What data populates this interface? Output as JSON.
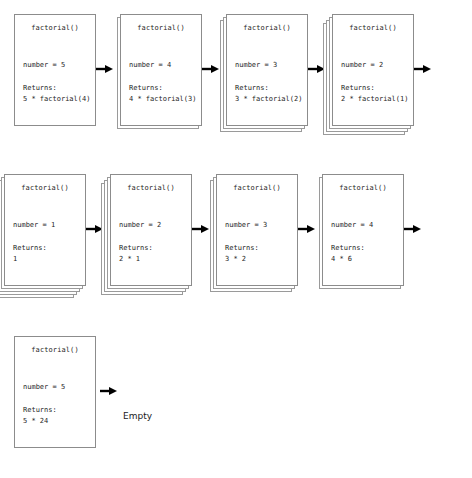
{
  "diagram": {
    "card_title": "factorial()",
    "returns_label": "Returns:",
    "empty_label": "Empty",
    "arrow_icon": "arrow-right-icon",
    "colors": {
      "background": "#ffffff",
      "card_border": "#8c8c8c",
      "layer_border": "#9a9a9a",
      "text": "#262626",
      "arrow": "#000000"
    },
    "rows": [
      {
        "name": "call-phase-row",
        "left_offset": 14,
        "cards": [
          {
            "title": "factorial()",
            "number": "number = 5",
            "returns_label": "Returns:",
            "returns_value": "5 * factorial(4)",
            "layers": 0
          },
          {
            "title": "factorial()",
            "number": "number = 4",
            "returns_label": "Returns:",
            "returns_value": "4 * factorial(3)",
            "layers": 1
          },
          {
            "title": "factorial()",
            "number": "number = 3",
            "returns_label": "Returns:",
            "returns_value": "3 * factorial(2)",
            "layers": 2
          },
          {
            "title": "factorial()",
            "number": "number = 2",
            "returns_label": "Returns:",
            "returns_value": "2 * factorial(1)",
            "layers": 3
          }
        ]
      },
      {
        "name": "return-phase-row",
        "left_offset": 4,
        "cards": [
          {
            "title": "factorial()",
            "number": "number = 1",
            "returns_label": "Returns:",
            "returns_value": "1",
            "layers": 4
          },
          {
            "title": "factorial()",
            "number": "number = 2",
            "returns_label": "Returns:",
            "returns_value": "2 * 1",
            "layers": 3
          },
          {
            "title": "factorial()",
            "number": "number = 3",
            "returns_label": "Returns:",
            "returns_value": "3 * 2",
            "layers": 2
          },
          {
            "title": "factorial()",
            "number": "number = 4",
            "returns_label": "Returns:",
            "returns_value": "4 * 6",
            "layers": 1
          }
        ]
      },
      {
        "name": "final-row",
        "left_offset": 14,
        "cards": [
          {
            "title": "factorial()",
            "number": "number = 5",
            "returns_label": "Returns:",
            "returns_value": "5 * 24",
            "layers": 0
          }
        ]
      }
    ]
  }
}
